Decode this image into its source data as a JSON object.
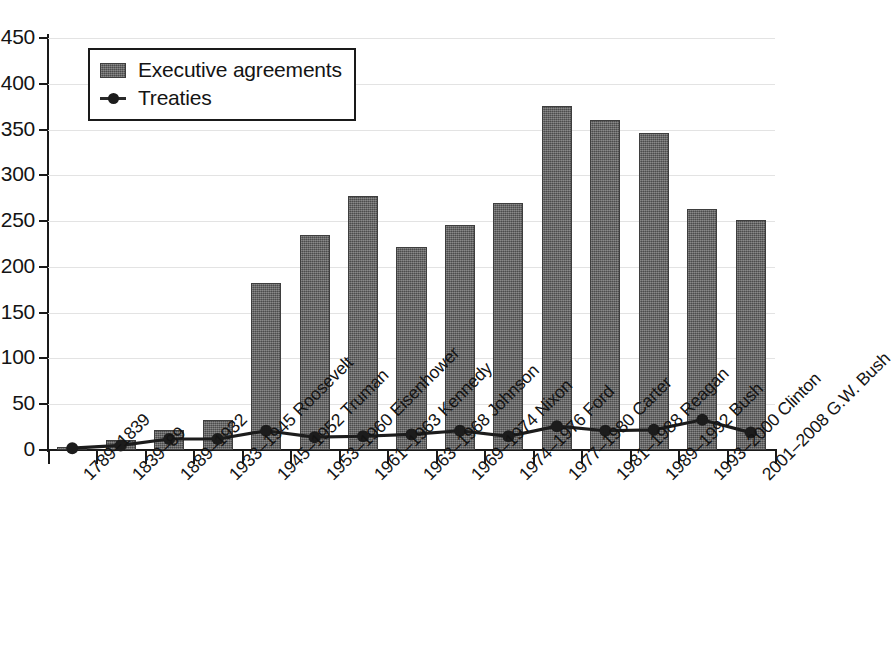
{
  "chart_data": {
    "type": "bar",
    "title": "",
    "subtitle": "",
    "xlabel": "",
    "ylabel": "",
    "ylim": [
      0,
      450
    ],
    "ytick_values": [
      0,
      50,
      100,
      150,
      200,
      250,
      300,
      350,
      400,
      450
    ],
    "ytick_labels": [
      "0",
      "50",
      "100",
      "150",
      "200",
      "250",
      "300",
      "350",
      "400",
      "450"
    ],
    "grid": true,
    "legend_position": "upper-left-inside",
    "categories": [
      "1789–1839",
      "1839–89",
      "1889–1932",
      "1933–1945 Roosevelt",
      "1945–1952 Truman",
      "1953–1960 Eisenhower",
      "1961–1963 Kennedy",
      "1963–1968 Johnson",
      "1969–1974 Nixon",
      "1974–1976 Ford",
      "1977–1980 Carter",
      "1981–1988 Reagan",
      "1989–1992 Bush",
      "1993–2000 Clinton",
      "2001–2008 G.W. Bush"
    ],
    "series": [
      {
        "name": "Executive agreements",
        "kind": "bar",
        "color": "#5d5d5d",
        "values": [
          3,
          11,
          22,
          33,
          182,
          235,
          277,
          222,
          246,
          270,
          376,
          360,
          346,
          263,
          251
        ]
      },
      {
        "name": "Treaties",
        "kind": "line",
        "color": "#1c1c1c",
        "values": [
          2,
          5,
          12,
          12,
          21,
          14,
          15,
          17,
          21,
          15,
          26,
          21,
          22,
          33,
          19
        ]
      }
    ]
  },
  "legend": {
    "items": [
      {
        "label": "Executive agreements",
        "marker": "bar-swatch"
      },
      {
        "label": "Treaties",
        "marker": "line-with-dot"
      }
    ]
  },
  "colors": {
    "bar_fill": "#5d5d5d",
    "bar_edge": "#3e3e3e",
    "line": "#1c1c1c",
    "axis": "#1a1a1a",
    "grid": "#e3e3e3",
    "text": "#141414",
    "background": "#ffffff"
  }
}
